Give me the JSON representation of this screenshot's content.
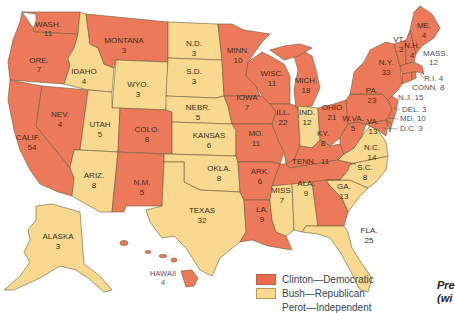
{
  "colors": {
    "clinton": "#ec7a5a",
    "bush": "#f8d98f",
    "border": "#6b5a3a"
  },
  "states": {
    "wa": {
      "name": "WASH.",
      "ev": "11",
      "winner": "Clinton"
    },
    "or": {
      "name": "ORE.",
      "ev": "7",
      "winner": "Clinton"
    },
    "ca": {
      "name": "CALIF.",
      "ev": "54",
      "winner": "Clinton"
    },
    "nv": {
      "name": "NEV.",
      "ev": "4",
      "winner": "Clinton"
    },
    "id": {
      "name": "IDAHO",
      "ev": "4",
      "winner": "Bush"
    },
    "mt": {
      "name": "MONTANA",
      "ev": "3",
      "winner": "Clinton"
    },
    "wy": {
      "name": "WYO.",
      "ev": "3",
      "winner": "Bush"
    },
    "ut": {
      "name": "UTAH",
      "ev": "5",
      "winner": "Bush"
    },
    "az": {
      "name": "ARIZ.",
      "ev": "8",
      "winner": "Bush"
    },
    "co": {
      "name": "COLO.",
      "ev": "8",
      "winner": "Clinton"
    },
    "nm": {
      "name": "N.M.",
      "ev": "5",
      "winner": "Clinton"
    },
    "nd": {
      "name": "N.D.",
      "ev": "3",
      "winner": "Bush"
    },
    "sd": {
      "name": "S.D.",
      "ev": "3",
      "winner": "Bush"
    },
    "ne": {
      "name": "NEBR.",
      "ev": "5",
      "winner": "Bush"
    },
    "ks": {
      "name": "KANSAS",
      "ev": "6",
      "winner": "Bush"
    },
    "ok": {
      "name": "OKLA.",
      "ev": "8",
      "winner": "Bush"
    },
    "tx": {
      "name": "TEXAS",
      "ev": "32",
      "winner": "Bush"
    },
    "mn": {
      "name": "MINN.",
      "ev": "10",
      "winner": "Clinton"
    },
    "ia": {
      "name": "IOWA",
      "ev": "7",
      "winner": "Clinton"
    },
    "mo": {
      "name": "MO.",
      "ev": "11",
      "winner": "Clinton"
    },
    "ar": {
      "name": "ARK.",
      "ev": "6",
      "winner": "Clinton"
    },
    "la": {
      "name": "LA.",
      "ev": "9",
      "winner": "Clinton"
    },
    "wi": {
      "name": "WISC.",
      "ev": "11",
      "winner": "Clinton"
    },
    "il": {
      "name": "ILL.",
      "ev": "22",
      "winner": "Clinton"
    },
    "mi": {
      "name": "MICH.",
      "ev": "18",
      "winner": "Clinton"
    },
    "in": {
      "name": "IND.",
      "ev": "12",
      "winner": "Bush"
    },
    "oh": {
      "name": "OHIO",
      "ev": "21",
      "winner": "Clinton"
    },
    "ky": {
      "name": "KY.",
      "ev": "8",
      "winner": "Clinton"
    },
    "tn": {
      "name": "TENN.",
      "ev": "11",
      "winner": "Clinton"
    },
    "ms": {
      "name": "MISS.",
      "ev": "7",
      "winner": "Bush"
    },
    "al": {
      "name": "ALA.",
      "ev": "9",
      "winner": "Bush"
    },
    "ga": {
      "name": "GA.",
      "ev": "13",
      "winner": "Clinton"
    },
    "fl": {
      "name": "FLA.",
      "ev": "25",
      "winner": "Bush"
    },
    "sc": {
      "name": "S.C.",
      "ev": "8",
      "winner": "Bush"
    },
    "nc": {
      "name": "N.C.",
      "ev": "14",
      "winner": "Bush"
    },
    "va": {
      "name": "VA.",
      "ev": "13",
      "winner": "Bush"
    },
    "wv": {
      "name": "W.VA.",
      "ev": "5",
      "winner": "Clinton"
    },
    "pa": {
      "name": "PA.",
      "ev": "23",
      "winner": "Clinton"
    },
    "ny": {
      "name": "N.Y.",
      "ev": "33",
      "winner": "Clinton"
    },
    "vt": {
      "name": "VT.",
      "ev": "3",
      "winner": "Clinton"
    },
    "nh": {
      "name": "N.H.",
      "ev": "4",
      "winner": "Clinton"
    },
    "me": {
      "name": "ME.",
      "ev": "4",
      "winner": "Clinton"
    },
    "ma": {
      "label": "MASS.",
      "ev": "12",
      "winner": "Clinton"
    },
    "ri": {
      "label": "R.I. 4",
      "winner": "Clinton"
    },
    "ct": {
      "label": "CONN. 8",
      "winner": "Clinton"
    },
    "nj": {
      "label": "N.J. 15",
      "winner": "Clinton"
    },
    "de": {
      "label": "DEL. 3",
      "winner": "Clinton"
    },
    "md": {
      "label": "MD. 10",
      "winner": "Clinton"
    },
    "dc": {
      "label": "D.C. 3",
      "winner": "Clinton"
    },
    "ak": {
      "name": "ALASKA",
      "ev": "3",
      "winner": "Bush"
    },
    "hi": {
      "name": "HAWAII",
      "ev": "4",
      "winner": "Clinton"
    }
  },
  "legend": {
    "items": [
      {
        "label": "Clinton—Democratic",
        "color": "#ec6a4a"
      },
      {
        "label": "Bush—Republican",
        "color": "#f8d98f"
      },
      {
        "label": "Perot—Independent",
        "color": "none"
      }
    ]
  },
  "caption": {
    "line1": "Pre",
    "line2": "(wi"
  }
}
